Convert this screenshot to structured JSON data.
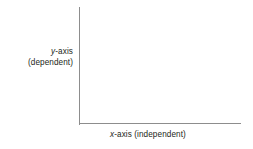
{
  "figure": {
    "background_color": "#ffffff",
    "axis_color": "#8d8d8d",
    "text_color": "#231f20"
  },
  "axes": {
    "y": {
      "variable": "y",
      "name_suffix": "-axis",
      "role": "(dependent)",
      "full_text": "y-axis (dependent)"
    },
    "x": {
      "variable": "x",
      "name_suffix": "-axis ",
      "role": "(independent)",
      "full_text": "x-axis (independent)"
    }
  },
  "chart_data": {
    "type": "line",
    "title": "",
    "subtitle": "",
    "xlabel": "x-axis (independent)",
    "ylabel": "y-axis (dependent)",
    "x": [],
    "series": [],
    "values": [],
    "categories": [],
    "xlim": null,
    "ylim": null,
    "xticks": [],
    "yticks": [],
    "xticklabels": [],
    "yticklabels": [],
    "grid": false,
    "legend": false,
    "legend_position": "none",
    "annotations": []
  }
}
